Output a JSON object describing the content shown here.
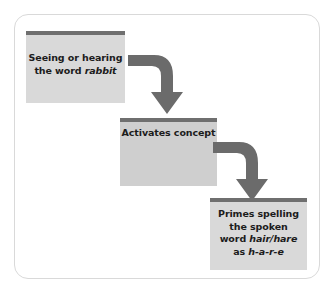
{
  "diagram": {
    "colors": {
      "node_fill_light": "#d9d9d9",
      "node_fill_dark": "#cfcfcf",
      "node_top_bar": "#6f6f6f",
      "arrow": "#6b6b6b",
      "frame_border": "#d9d9d9",
      "text": "#1c1c1c",
      "background": "#ffffff"
    },
    "nodes": [
      {
        "id": "stimulus",
        "label": "Seeing or hearing\nthe word rabbit",
        "line1": "Seeing or hearing",
        "line2_plain": "the word ",
        "line2_italic": "rabbit"
      },
      {
        "id": "concept",
        "label": "Activates concept"
      },
      {
        "id": "spelling",
        "label": "Primes spelling\nthe spoken\nword hair/hare\nas h-a-r-e",
        "line1": "Primes spelling",
        "line2": "the spoken",
        "line3_plain": "word ",
        "line3_italic": "hair/hare",
        "line4_plain": "as ",
        "line4_italic": "h-a-r-e"
      }
    ],
    "arrows": [
      {
        "id": "arrow-1",
        "from": "stimulus",
        "to": "concept",
        "shape": "elbow-right-down"
      },
      {
        "id": "arrow-2",
        "from": "concept",
        "to": "spelling",
        "shape": "elbow-right-down"
      }
    ]
  }
}
